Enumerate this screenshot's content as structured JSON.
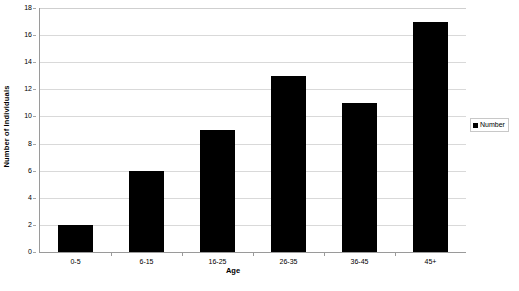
{
  "chart_data": {
    "type": "bar",
    "title": "",
    "categories": [
      "0-5",
      "6-15",
      "16-25",
      "26-35",
      "36-45",
      "45+"
    ],
    "values": [
      2,
      6,
      9,
      13,
      11,
      17
    ],
    "series": [
      {
        "name": "Number",
        "values": [
          2,
          6,
          9,
          13,
          11,
          17
        ]
      }
    ],
    "xlabel": "Age",
    "ylabel": "Number of Individuals",
    "ylim": [
      0,
      18
    ],
    "ytick_step": 2,
    "yticks": [
      0,
      2,
      4,
      6,
      8,
      10,
      12,
      14,
      16,
      18
    ],
    "ytick_labels": [
      "0",
      "2",
      "4",
      "6",
      "8",
      "10",
      "12",
      "14",
      "16",
      "18"
    ],
    "grid": "horizontal",
    "legend_position": "right",
    "legend_entries": [
      "Number"
    ],
    "bar_color": "#000000",
    "gridline_color": "#d9d9d9",
    "axis_color": "#9a9a9a",
    "plot_background": "#ffffff"
  },
  "legend": {
    "entries": [
      {
        "label": "Number",
        "color": "#000000"
      }
    ]
  },
  "axes": {
    "x_title": "Age",
    "y_title": "Number of Individuals"
  },
  "caption": {
    "clipped_text": ""
  }
}
